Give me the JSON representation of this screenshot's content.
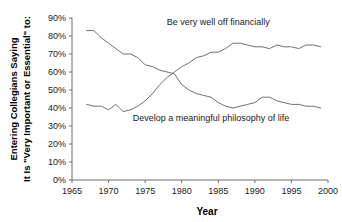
{
  "chart_data": {
    "type": "line",
    "title": "",
    "xlabel": "Year",
    "ylabel": "Entering Collegians Saying It Is \"Very Important or Essential\" to:",
    "ylabel_lines": [
      "Entering Collegians Saying",
      "It Is \"Very Important or Essential\" to:"
    ],
    "xlim": [
      1965,
      2000
    ],
    "ylim": [
      0,
      90
    ],
    "xticks": [
      1965,
      1970,
      1975,
      1980,
      1985,
      1990,
      1995,
      2000
    ],
    "xtick_labels": [
      "1965",
      "1970",
      "1975",
      "1980",
      "1985",
      "1990",
      "1995",
      "2000"
    ],
    "yticks": [
      0,
      10,
      20,
      30,
      40,
      50,
      60,
      70,
      80,
      90
    ],
    "ytick_labels": [
      "0%",
      "10%",
      "20%",
      "30%",
      "40%",
      "50%",
      "60%",
      "70%",
      "80%",
      "90%"
    ],
    "grid": false,
    "legend_position": "inline-annotation",
    "line_color": "#707070",
    "x": [
      1967,
      1968,
      1969,
      1970,
      1971,
      1972,
      1973,
      1974,
      1975,
      1976,
      1977,
      1978,
      1979,
      1980,
      1981,
      1982,
      1983,
      1984,
      1985,
      1986,
      1987,
      1988,
      1989,
      1990,
      1991,
      1992,
      1993,
      1994,
      1995,
      1996,
      1997,
      1998,
      1999
    ],
    "series": [
      {
        "name": "Be very well off financially",
        "label": "Be very well off financially",
        "values": [
          42,
          41,
          41,
          39,
          42,
          38,
          39,
          41,
          44,
          48,
          53,
          57,
          60,
          63,
          65,
          68,
          69,
          71,
          71,
          73,
          76,
          76,
          75,
          74,
          74,
          73,
          75,
          74,
          74,
          73,
          75,
          75,
          74
        ],
        "annotation_x": 1985,
        "annotation_y": 86
      },
      {
        "name": "Develop a meaningful philosophy of life",
        "label": "Develop a meaningful philosophy of life",
        "values": [
          83,
          83,
          79,
          76,
          73,
          70,
          70,
          68,
          64,
          63,
          61,
          60,
          59,
          53,
          50,
          48,
          47,
          46,
          43,
          41,
          40,
          41,
          42,
          43,
          46,
          46,
          44,
          43,
          42,
          42,
          41,
          41,
          40
        ],
        "annotation_x": 1984,
        "annotation_y": 33
      }
    ]
  }
}
